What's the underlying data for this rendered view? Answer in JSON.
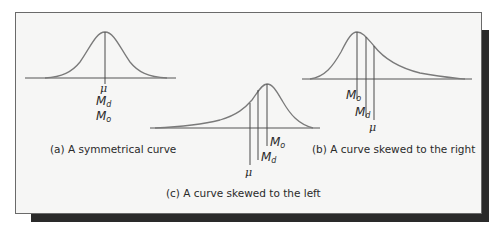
{
  "figure": {
    "panels": [
      {
        "id": "a",
        "caption": "(a) A symmetrical curve",
        "shape": "symmetrical",
        "markers": [
          {
            "symbol": "μ",
            "name": "mean"
          },
          {
            "symbol": "M",
            "sub": "d",
            "name": "median"
          },
          {
            "symbol": "M",
            "sub": "o",
            "name": "mode"
          }
        ]
      },
      {
        "id": "b",
        "caption": "(b) A curve skewed to the right",
        "shape": "right-skewed",
        "markers": [
          {
            "symbol": "M",
            "sub": "o",
            "name": "mode"
          },
          {
            "symbol": "M",
            "sub": "d",
            "name": "median"
          },
          {
            "symbol": "μ",
            "name": "mean"
          }
        ]
      },
      {
        "id": "c",
        "caption": "(c) A curve skewed to the left",
        "shape": "left-skewed",
        "markers": [
          {
            "symbol": "M",
            "sub": "o",
            "name": "mode"
          },
          {
            "symbol": "M",
            "sub": "d",
            "name": "median"
          },
          {
            "symbol": "μ",
            "name": "mean"
          }
        ]
      }
    ],
    "colors": {
      "curve": "#7a7a7a",
      "marker_line": "#4a4a4a",
      "axis": "#555555",
      "frame_bg": "#f6f6f5",
      "shadow": "#2a2a2a"
    }
  }
}
